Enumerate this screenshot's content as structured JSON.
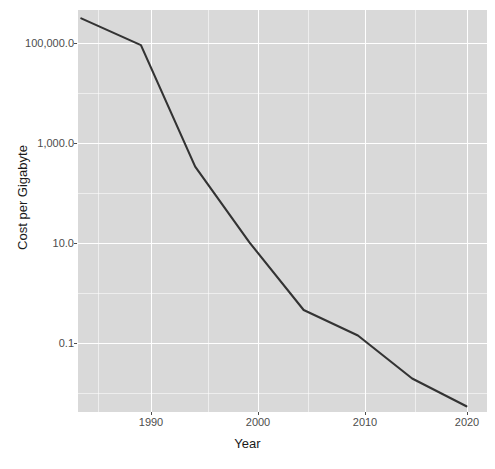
{
  "chart_data": {
    "type": "line",
    "title": "",
    "xlabel": "Year",
    "ylabel": "Cost per Gigabyte",
    "yscale": "log10",
    "xlim": [
      1984.2,
      2021.9
    ],
    "ylim": [
      0.006,
      260000
    ],
    "grid": true,
    "legend": "none",
    "x": [
      1984.5,
      1990,
      1995,
      2000,
      2005,
      2010,
      2015,
      2020
    ],
    "y": [
      180000,
      56000,
      275,
      10,
      0.52,
      0.17,
      0.026,
      0.0077
    ],
    "series": [
      {
        "name": "Cost per Gigabyte",
        "color": "#333333",
        "x": [
          1984.5,
          1990,
          1995,
          2000,
          2005,
          2010,
          2015,
          2020
        ],
        "values": [
          180000,
          56000,
          275,
          10,
          0.52,
          0.17,
          0.026,
          0.0077
        ]
      }
    ],
    "xticks": [
      {
        "value": 1990,
        "label": "1990"
      },
      {
        "value": 2000,
        "label": "2000"
      },
      {
        "value": 2010,
        "label": "2010"
      },
      {
        "value": 2020,
        "label": "2020"
      }
    ],
    "yticks": [
      {
        "value": 100000,
        "label": "100,000.0"
      },
      {
        "value": 1000,
        "label": "1,000.0"
      },
      {
        "value": 10,
        "label": "10.0"
      },
      {
        "value": 0.1,
        "label": "0.1"
      }
    ],
    "y_minor_ticks": [
      10000,
      100,
      1,
      0.01
    ],
    "x_minor_ticks": [
      1985,
      1995,
      2005,
      2015
    ],
    "colors": {
      "panel_background": "#d9d9d9",
      "gridline": "#ffffff",
      "line": "#333333",
      "tick_label": "#4d4d4d",
      "axis_title": "#1a1a1a",
      "figure_background": "#ffffff"
    }
  }
}
